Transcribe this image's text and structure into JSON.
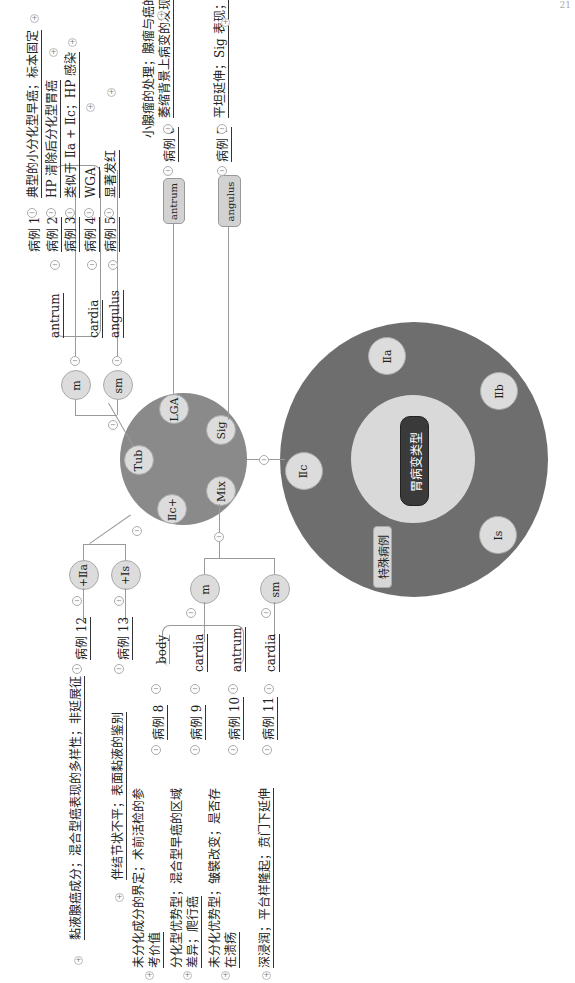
{
  "page_number": "21",
  "colors": {
    "outer_ring": "#6e6e6e",
    "inner_disc": "#d9d9d9",
    "mid_circle": "#8a8a8a",
    "node_fill": "#dcdcdc",
    "root_pill": "#3a3a3a",
    "line": "#9a9a9a"
  },
  "root": {
    "label": "胃病变类型",
    "ring_nodes": [
      "Ⅱa",
      "Ⅱb",
      "Ⅱc",
      "Ⅰs"
    ],
    "special_label": "特殊病例"
  },
  "iic_hub": {
    "nodes": [
      "Tub",
      "LGA",
      "Sig",
      "Mix",
      "Ⅱc+"
    ]
  },
  "tub_branch": {
    "depths": [
      "m",
      "sm"
    ],
    "m_sites": [
      "antrum",
      "cardia"
    ],
    "sm_sites": [
      "angulus"
    ],
    "cases": [
      {
        "case": "病例 1",
        "note": "典型的小分化型早癌；标本固定"
      },
      {
        "case": "病例 2",
        "note": "HP 清除后分化型胃癌"
      },
      {
        "case": "病例 3",
        "note": "类似于 Ⅱa + Ⅱc；HP 感染"
      },
      {
        "case": "病例 4",
        "note": "WGA"
      },
      {
        "case": "病例 5",
        "note": "显著发红"
      }
    ]
  },
  "lga_branch": {
    "site": "antrum",
    "case": "病例 6",
    "note_line1": "小腺瘤的处理；腺瘤与癌的鉴别；",
    "note_line2": "萎缩背景上病变的发现"
  },
  "sig_branch": {
    "site": "angulus",
    "case": "病例 7",
    "note": "平坦延伸；Sig 表现；摄片方向"
  },
  "mix_branch": {
    "depths": [
      "m",
      "sm"
    ],
    "cases": [
      {
        "site": "body",
        "case": "病例 8",
        "note_line1": "未分化成分的界定；术前活检的参",
        "note_line2": "考价值"
      },
      {
        "site": "cardia",
        "case": "病例 9",
        "note_line1": "分化型优势型；混合型早癌的区域",
        "note_line2": "差异；爬行癌"
      },
      {
        "site": "antrum",
        "case": "病例 10",
        "note_line1": "未分化优势型；皱襞改变；是否存",
        "note_line2": "在溃疡"
      },
      {
        "site": "cardia",
        "case": "病例 11",
        "note_line1": "深浸润；平台样隆起；贲门下延伸",
        "note_line2": ""
      }
    ]
  },
  "iic_plus_branch": {
    "nodes": [
      "+Ⅱa",
      "+Ⅰs"
    ],
    "cases": [
      {
        "case": "病例 12",
        "note": "黏液腺癌成分；混合型癌表现的多样性；非延展征"
      },
      {
        "case": "病例 13",
        "note": "伴结节状不平；表面黏液的鉴别"
      }
    ]
  },
  "toggle_minus": "−",
  "toggle_plus": "+"
}
